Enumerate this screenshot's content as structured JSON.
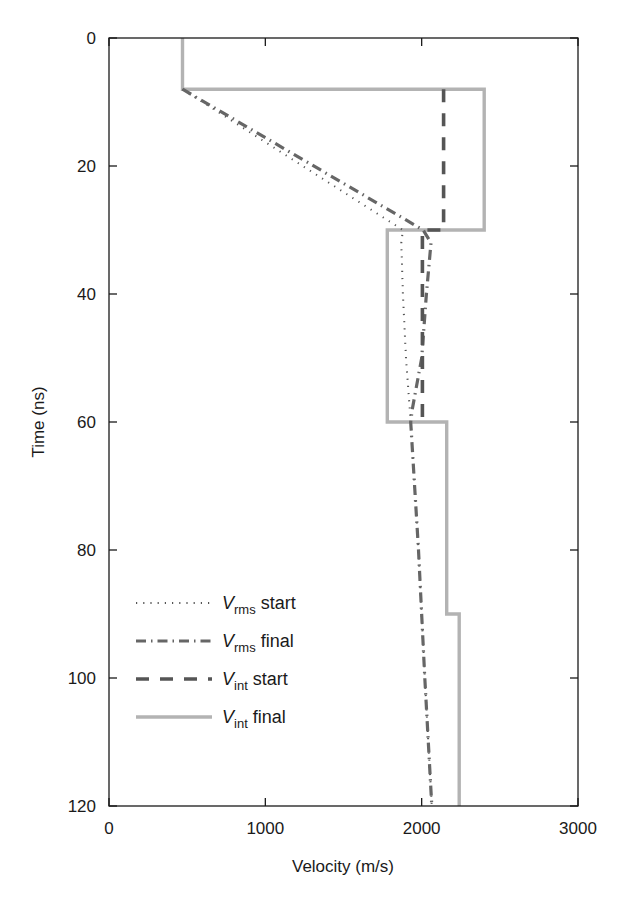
{
  "chart_data": {
    "type": "line",
    "title": "",
    "xlabel": "Velocity (m/s)",
    "ylabel": "Time (ns)",
    "xlim": [
      0,
      3000
    ],
    "ylim": [
      0,
      120
    ],
    "y_inverted": true,
    "x_ticks": [
      0,
      1000,
      2000,
      3000
    ],
    "y_ticks": [
      0,
      20,
      40,
      60,
      80,
      100,
      120
    ],
    "grid": false,
    "legend_position": "lower left",
    "series": [
      {
        "name": "V_rms start",
        "label_main": "V",
        "label_sub": "rms",
        "label_rest": " start",
        "style": "dotted",
        "color": "#555555",
        "points": [
          [
            470,
            8
          ],
          [
            1880,
            30
          ],
          [
            1870,
            32
          ],
          [
            1880,
            40
          ],
          [
            1900,
            50
          ],
          [
            1930,
            60
          ],
          [
            1980,
            80
          ],
          [
            2020,
            100
          ],
          [
            2065,
            120
          ]
        ]
      },
      {
        "name": "V_rms final",
        "label_main": "V",
        "label_sub": "rms",
        "label_rest": " final",
        "style": "dashdot",
        "color": "#666666",
        "points": [
          [
            470,
            8
          ],
          [
            2010,
            30
          ],
          [
            2060,
            32
          ],
          [
            2030,
            40
          ],
          [
            2000,
            50
          ],
          [
            1940,
            58
          ],
          [
            1930,
            60
          ],
          [
            1980,
            80
          ],
          [
            2020,
            100
          ],
          [
            2065,
            120
          ]
        ]
      },
      {
        "name": "V_int start",
        "label_main": "V",
        "label_sub": "int",
        "label_rest": " start",
        "style": "dashed",
        "color": "#555555",
        "points": [
          [
            2140,
            8
          ],
          [
            2140,
            30
          ],
          [
            2005,
            30
          ],
          [
            2005,
            60
          ]
        ]
      },
      {
        "name": "V_int final",
        "label_main": "V",
        "label_sub": "int",
        "label_rest": " final",
        "style": "solid",
        "color": "#b3b3b3",
        "points": [
          [
            470,
            0
          ],
          [
            470,
            8
          ],
          [
            2400,
            8
          ],
          [
            2400,
            30
          ],
          [
            1780,
            30
          ],
          [
            1780,
            60
          ],
          [
            2160,
            60
          ],
          [
            2160,
            90
          ],
          [
            2240,
            90
          ],
          [
            2240,
            120
          ]
        ]
      }
    ]
  }
}
